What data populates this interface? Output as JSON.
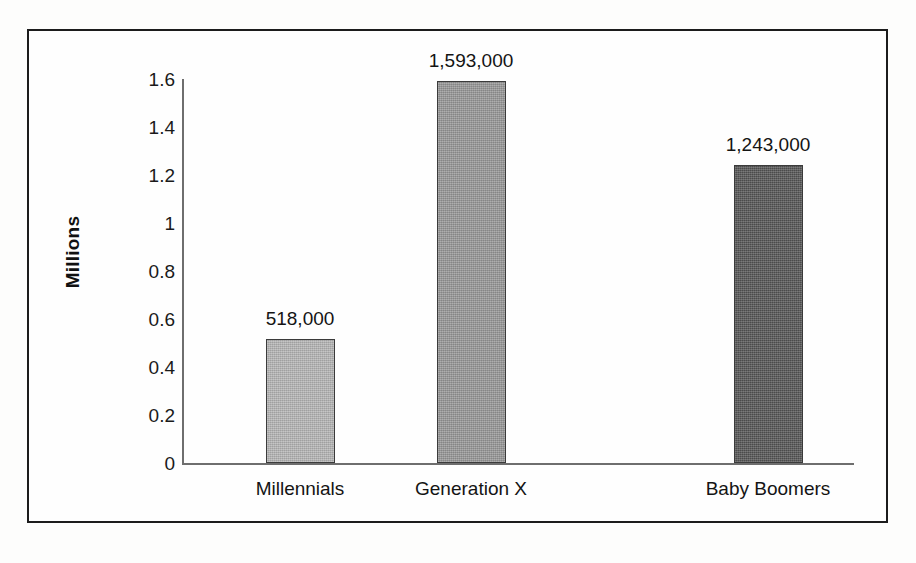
{
  "chart_data": {
    "type": "bar",
    "title": "",
    "subtitle": "",
    "xlabel": "",
    "ylabel": "Millions",
    "categories": [
      "Millennials",
      "Generation X",
      "Baby Boomers"
    ],
    "values": [
      0.518,
      1.593,
      1.243
    ],
    "data_labels": [
      "518,000",
      "1,593,000",
      "1,243,000"
    ],
    "ylim": [
      0,
      1.6
    ],
    "ytick_labels": [
      "1.6",
      "1.4",
      "1.2",
      "1",
      "0.8",
      "0.6",
      "0.4",
      "0.2",
      "0"
    ],
    "ytick_values": [
      1.6,
      1.4,
      1.2,
      1.0,
      0.8,
      0.6,
      0.4,
      0.2,
      0
    ],
    "grid": false,
    "legend": false,
    "legend_position": "none",
    "bar_colors": [
      "#b5b5b5",
      "#979797",
      "#555555"
    ],
    "bar_border_color": "#3b3b3b",
    "axis_color": "#6e6e6e",
    "frame_color": "#1c1c1c",
    "background_color": "#fefefe",
    "text_color": "#141414"
  }
}
